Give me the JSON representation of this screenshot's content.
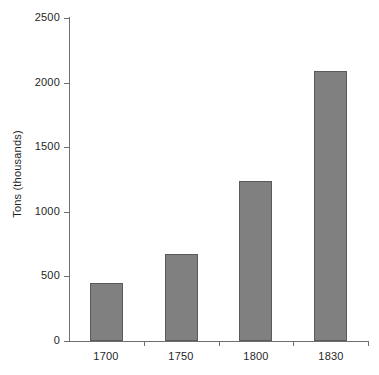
{
  "chart_data": {
    "type": "bar",
    "title": "",
    "xlabel": "",
    "ylabel": "Tons (thousands)",
    "categories": [
      "1700",
      "1750",
      "1800",
      "1830"
    ],
    "values": [
      450,
      675,
      1240,
      2090
    ],
    "series": [
      {
        "name": "Tons (thousands)",
        "values": [
          450,
          675,
          1240,
          2090
        ]
      }
    ],
    "ylim": [
      0,
      2500
    ],
    "y_ticks": [
      0,
      500,
      1000,
      1500,
      2000,
      2500
    ],
    "y_tick_labels": [
      "0",
      "500",
      "1000",
      "1500",
      "2000",
      "2500"
    ],
    "x_tick_labels": [
      "1700",
      "1750",
      "1800",
      "1830"
    ],
    "grid": false,
    "legend": false,
    "legend_position": "none",
    "bar_color": "#808080",
    "bar_border_color": "#5a5a5a",
    "axis_color": "#6e6e6e",
    "background_color": "#ffffff",
    "text_color": "#1f1f1f"
  }
}
